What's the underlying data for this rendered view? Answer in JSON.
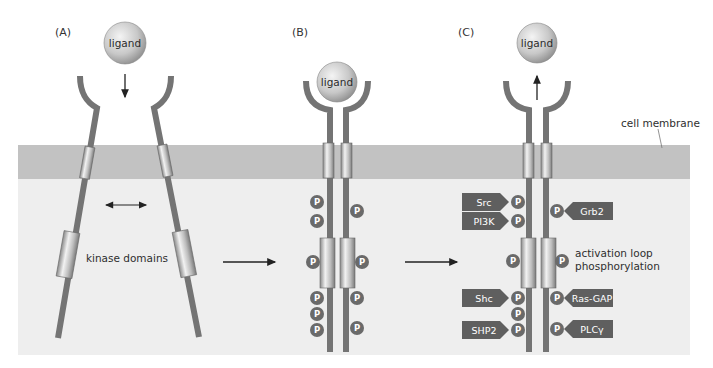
{
  "figure": {
    "panels": [
      {
        "id": "A",
        "label": "(A)",
        "ligand": "ligand",
        "annotation": "kinase domains",
        "ligand_motion": "down"
      },
      {
        "id": "B",
        "label": "(B)",
        "ligand": "ligand"
      },
      {
        "id": "C",
        "label": "(C)",
        "ligand": "ligand",
        "ligand_motion": "up",
        "annotation": [
          "activation loop",
          "phosphorylation"
        ]
      }
    ],
    "membrane_label": "cell membrane",
    "phospho_symbol": "P",
    "binding_proteins": {
      "left": [
        "Src",
        "PI3K",
        "Shc",
        "SHP2"
      ],
      "right": [
        "Grb2",
        "Ras-GAP",
        "PLCγ"
      ]
    },
    "colors": {
      "membrane": "#c2c2c2",
      "cytoplasm": "#eeeeee",
      "stalk": "#747474",
      "phospho": "#6a6a6a",
      "tag": "#5f5f5f"
    }
  }
}
